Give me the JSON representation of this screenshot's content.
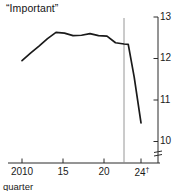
{
  "chart_data": {
    "type": "line",
    "title": "“Important”",
    "xlabel": "quarter",
    "ylabel": "",
    "x_tick_labels": [
      "2010",
      "15",
      "20",
      "24"
    ],
    "x_tick_values": [
      2010,
      2015,
      2020,
      2024
    ],
    "x_tick_suffixes": [
      "",
      "",
      "",
      "†"
    ],
    "y_tick_labels": [
      "13",
      "12",
      "11",
      "10"
    ],
    "y_tick_values": [
      13,
      12,
      11,
      10
    ],
    "xlim": [
      2009.4,
      2024.6
    ],
    "ylim": [
      9.55,
      13.05
    ],
    "grid": false,
    "legend": null,
    "y_axis_position": "right",
    "y_axis_break": true,
    "forecast_divider_x": 2022.5,
    "series": [
      {
        "name": "Important",
        "color": "#1a1a1a",
        "x": [
          2010,
          2011,
          2012,
          2013,
          2014,
          2015,
          2016,
          2017,
          2018,
          2019,
          2020,
          2021,
          2022,
          2022.5,
          2023.2,
          2024
        ],
        "values": [
          11.95,
          12.13,
          12.3,
          12.48,
          12.63,
          12.61,
          12.55,
          12.56,
          12.6,
          12.55,
          12.54,
          12.38,
          12.35,
          12.34,
          11.55,
          10.45
        ]
      }
    ],
    "annotations": [
      {
        "name": "forecast-divider",
        "x": 2022.5,
        "note": "vertical rule separating actual from projection"
      },
      {
        "name": "axis-break",
        "note": "double-tick break mark on value axis below 10"
      }
    ]
  }
}
